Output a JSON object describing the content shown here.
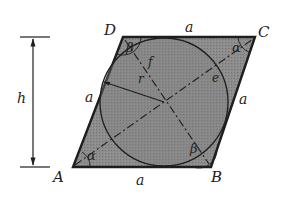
{
  "figure": {
    "colors": {
      "fill": "#8a8a8a",
      "stroke": "#1e1e1e",
      "circle_fill": "#7d7d7d",
      "text": "#222222",
      "background": "#ffffff"
    },
    "vertices": {
      "A": {
        "label": "A",
        "x": 73,
        "y": 167
      },
      "B": {
        "label": "B",
        "x": 211,
        "y": 167
      },
      "C": {
        "label": "C",
        "x": 255,
        "y": 37
      },
      "D": {
        "label": "D",
        "x": 123,
        "y": 37
      }
    },
    "sides": {
      "top": "a",
      "bottom": "a",
      "left": "a",
      "right": "a"
    },
    "angles": {
      "at_A": "α",
      "at_C": "α",
      "at_D": "β",
      "at_B": "β"
    },
    "inner_labels": {
      "radius": "r",
      "diagonal_f": "f",
      "diagonal_e": "e"
    },
    "height": {
      "label": "h"
    },
    "circle": {
      "cx": 164,
      "cy": 102,
      "r": 64
    }
  }
}
